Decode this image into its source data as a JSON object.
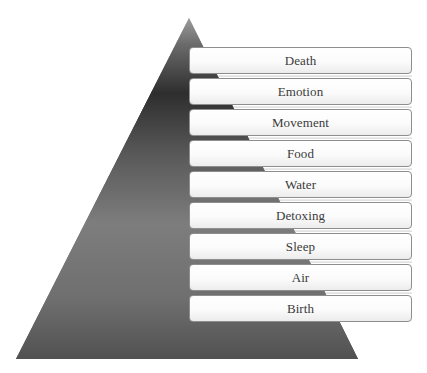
{
  "diagram": {
    "type": "pyramid",
    "colors": {
      "pyramid_top": "#b5b5b5",
      "pyramid_dark": "#2a2a2a",
      "pyramid_mid": "#808080",
      "pyramid_bottom": "#4a4a4a",
      "box_border": "#8e8e8e",
      "box_fill": "#ffffff",
      "text": "#3a3a3a"
    },
    "levels": [
      {
        "label": "Death"
      },
      {
        "label": "Emotion"
      },
      {
        "label": "Movement"
      },
      {
        "label": "Food"
      },
      {
        "label": "Water"
      },
      {
        "label": "Detoxing"
      },
      {
        "label": "Sleep"
      },
      {
        "label": "Air"
      },
      {
        "label": "Birth"
      }
    ]
  }
}
